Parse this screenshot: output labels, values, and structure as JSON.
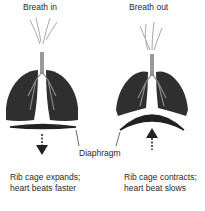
{
  "left": {
    "title": "Breath in",
    "caption_line1": "Rib cage expands;",
    "caption_line2": "heart beats faster"
  },
  "right": {
    "title": "Breath out",
    "caption_line1": "Rib cage contracts;",
    "caption_line2": "heart beat slows"
  },
  "shared": {
    "diaphragm_label": "Diaphragm"
  },
  "colors": {
    "lung": "#2f2f2f",
    "airway": "#9a9a9a",
    "arrow": "#222222"
  }
}
